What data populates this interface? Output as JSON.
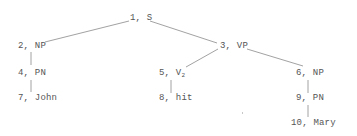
{
  "diagram": {
    "type": "syntax-tree",
    "nodes": [
      {
        "id": 1,
        "num": "1",
        "sep": ", ",
        "label": "S",
        "sub": ""
      },
      {
        "id": 2,
        "num": "2",
        "sep": ", ",
        "label": "NP",
        "sub": ""
      },
      {
        "id": 3,
        "num": "3",
        "sep": ", ",
        "label": "VP",
        "sub": ""
      },
      {
        "id": 4,
        "num": "4",
        "sep": ", ",
        "label": "PN",
        "sub": ""
      },
      {
        "id": 5,
        "num": "5",
        "sep": ", ",
        "label": "V",
        "sub": "2"
      },
      {
        "id": 6,
        "num": "6",
        "sep": ", ",
        "label": "NP",
        "sub": ""
      },
      {
        "id": 7,
        "num": "7",
        "sep": ", ",
        "label": "John",
        "sub": ""
      },
      {
        "id": 8,
        "num": "8",
        "sep": ", ",
        "label": "hit",
        "sub": ""
      },
      {
        "id": 9,
        "num": "9",
        "sep": ", ",
        "label": "PN",
        "sub": ""
      },
      {
        "id": 10,
        "num": "10",
        "sep": ", ",
        "label": "Mary",
        "sub": ""
      }
    ],
    "edges": [
      {
        "from": 1,
        "to": 2
      },
      {
        "from": 1,
        "to": 3
      },
      {
        "from": 2,
        "to": 4
      },
      {
        "from": 4,
        "to": 7
      },
      {
        "from": 3,
        "to": 5
      },
      {
        "from": 3,
        "to": 6
      },
      {
        "from": 5,
        "to": 8
      },
      {
        "from": 6,
        "to": 9
      },
      {
        "from": 9,
        "to": 10
      }
    ],
    "colors": {
      "text": "#555555",
      "edge": "#8a8a8a",
      "background": "#ffffff"
    }
  }
}
